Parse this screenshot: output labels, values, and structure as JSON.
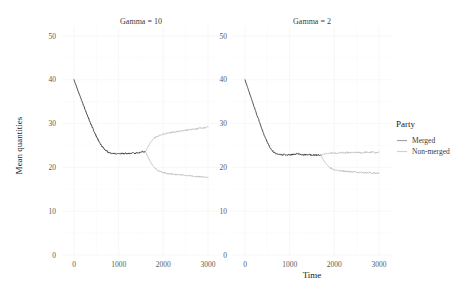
{
  "chart_data": {
    "type": "line",
    "title": "",
    "xlabel": "Time",
    "ylabel": "Mean quantities",
    "xlim": [
      0,
      3000
    ],
    "ylim": [
      0,
      50
    ],
    "xticks": [
      0,
      1000,
      2000,
      3000
    ],
    "yticks": [
      0,
      10,
      20,
      30,
      40,
      50
    ],
    "grid": true,
    "legend": {
      "title": "Party",
      "position": "right",
      "entries": [
        {
          "label": "Merged",
          "color": "#8a8a8a"
        },
        {
          "label": "Non-merged",
          "color": "#c4c4c4"
        }
      ]
    },
    "facets": [
      {
        "title": "Gamma = 10",
        "series": [
          {
            "name": "Merged",
            "color": "#3c3c3c",
            "x": [
              0,
              50,
              100,
              150,
              200,
              250,
              300,
              350,
              400,
              450,
              500,
              550,
              600,
              650,
              700,
              750,
              800,
              850,
              900,
              950,
              1000,
              1050,
              1100,
              1150,
              1200,
              1250,
              1300,
              1350,
              1400,
              1450,
              1500,
              1550,
              1600
            ],
            "y": [
              40.0,
              38.6,
              37.2,
              35.9,
              34.5,
              33.2,
              31.9,
              30.6,
              29.4,
              28.2,
              27.1,
              26.1,
              25.2,
              24.5,
              24.0,
              23.6,
              23.3,
              23.2,
              23.2,
              23.1,
              23.1,
              23.2,
              23.1,
              23.2,
              23.1,
              23.2,
              23.3,
              23.2,
              23.3,
              23.4,
              23.5,
              23.6,
              23.6
            ]
          },
          {
            "name": "Non-merged (upper branch)",
            "color": "#bdbdbd",
            "x": [
              1600,
              1650,
              1700,
              1750,
              1800,
              1850,
              1900,
              1950,
              2000,
              2050,
              2100,
              2150,
              2200,
              2250,
              2300,
              2350,
              2400,
              2450,
              2500,
              2550,
              2600,
              2650,
              2700,
              2750,
              2800,
              2850,
              2900,
              2950,
              3000
            ],
            "y": [
              23.6,
              24.6,
              25.5,
              26.2,
              26.7,
              27.0,
              27.2,
              27.4,
              27.6,
              27.7,
              27.8,
              27.9,
              28.0,
              28.1,
              28.2,
              28.2,
              28.3,
              28.4,
              28.5,
              28.5,
              28.6,
              28.7,
              28.8,
              28.8,
              28.9,
              29.0,
              29.0,
              29.1,
              29.2
            ]
          },
          {
            "name": "Non-merged (lower branch)",
            "color": "#bdbdbd",
            "x": [
              1600,
              1650,
              1700,
              1750,
              1800,
              1850,
              1900,
              1950,
              2000,
              2050,
              2100,
              2150,
              2200,
              2250,
              2300,
              2350,
              2400,
              2450,
              2500,
              2550,
              2600,
              2650,
              2700,
              2750,
              2800,
              2850,
              2900,
              2950,
              3000
            ],
            "y": [
              23.6,
              22.5,
              21.5,
              20.6,
              20.0,
              19.5,
              19.2,
              19.0,
              18.8,
              18.7,
              18.6,
              18.5,
              18.5,
              18.4,
              18.4,
              18.3,
              18.3,
              18.2,
              18.2,
              18.1,
              18.1,
              18.0,
              18.0,
              17.9,
              17.9,
              17.8,
              17.8,
              17.8,
              17.7
            ]
          }
        ]
      },
      {
        "title": "Gamma = 2",
        "series": [
          {
            "name": "Merged",
            "color": "#3c3c3c",
            "x": [
              0,
              50,
              100,
              150,
              200,
              250,
              300,
              350,
              400,
              450,
              500,
              550,
              600,
              650,
              700,
              750,
              800,
              850,
              900,
              950,
              1000,
              1050,
              1100,
              1150,
              1200,
              1250,
              1300,
              1350,
              1400,
              1450,
              1500,
              1550,
              1600,
              1650,
              1700
            ],
            "y": [
              40.0,
              38.5,
              37.0,
              35.5,
              34.0,
              32.5,
              31.0,
              29.6,
              28.2,
              26.9,
              25.7,
              24.7,
              23.9,
              23.4,
              23.1,
              23.0,
              22.9,
              22.9,
              22.9,
              22.8,
              22.9,
              22.9,
              23.0,
              23.1,
              23.1,
              23.0,
              22.9,
              22.9,
              22.9,
              22.9,
              22.8,
              22.8,
              22.8,
              22.8,
              22.8
            ]
          },
          {
            "name": "Non-merged (upper branch)",
            "color": "#bdbdbd",
            "x": [
              1700,
              1750,
              1800,
              1850,
              1900,
              1950,
              2000,
              2050,
              2100,
              2150,
              2200,
              2250,
              2300,
              2350,
              2400,
              2450,
              2500,
              2550,
              2600,
              2650,
              2700,
              2750,
              2800,
              2850,
              2900,
              2950,
              3000
            ],
            "y": [
              22.8,
              23.0,
              23.1,
              23.2,
              23.2,
              23.3,
              23.3,
              23.2,
              23.3,
              23.4,
              23.3,
              23.3,
              23.4,
              23.3,
              23.4,
              23.3,
              23.4,
              23.4,
              23.3,
              23.4,
              23.5,
              23.4,
              23.4,
              23.5,
              23.4,
              23.4,
              23.5
            ]
          },
          {
            "name": "Non-merged (lower branch)",
            "color": "#bdbdbd",
            "x": [
              1700,
              1750,
              1800,
              1850,
              1900,
              1950,
              2000,
              2050,
              2100,
              2150,
              2200,
              2250,
              2300,
              2350,
              2400,
              2450,
              2500,
              2550,
              2600,
              2650,
              2700,
              2750,
              2800,
              2850,
              2900,
              2950,
              3000
            ],
            "y": [
              22.8,
              21.8,
              21.0,
              20.4,
              20.0,
              19.7,
              19.5,
              19.4,
              19.3,
              19.2,
              19.2,
              19.1,
              19.1,
              19.0,
              19.0,
              19.0,
              18.9,
              18.9,
              18.9,
              18.8,
              18.8,
              18.8,
              18.8,
              18.7,
              18.7,
              18.7,
              18.7
            ]
          }
        ]
      }
    ]
  }
}
